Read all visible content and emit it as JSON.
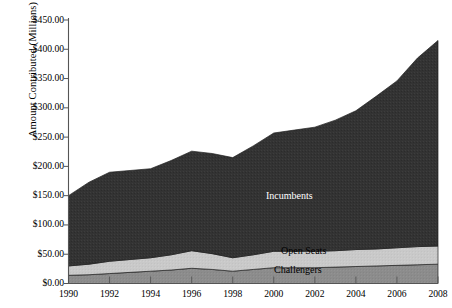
{
  "chart_data": {
    "type": "area",
    "stacked": true,
    "title": "",
    "xlabel": "",
    "ylabel": "Amount Contributed (Millions)",
    "x": [
      1990,
      1991,
      1992,
      1993,
      1994,
      1995,
      1996,
      1997,
      1998,
      1999,
      2000,
      2001,
      2002,
      2003,
      2004,
      2005,
      2006,
      2007,
      2008
    ],
    "xtick_labels": [
      "1990",
      "1992",
      "1994",
      "1996",
      "1998",
      "2000",
      "2002",
      "2004",
      "2006",
      "2008"
    ],
    "xticks": [
      1990,
      1992,
      1994,
      1996,
      1998,
      2000,
      2002,
      2004,
      2006,
      2008
    ],
    "xlim": [
      1990,
      2008
    ],
    "ylim": [
      0,
      450
    ],
    "yticks": [
      0,
      50,
      100,
      150,
      200,
      250,
      300,
      350,
      400,
      450
    ],
    "ytick_labels": [
      "$0.00",
      "$50.00",
      "$100.00",
      "$150.00",
      "$200.00",
      "$250.00",
      "$300.00",
      "$350.00",
      "$400.00",
      "$450.00"
    ],
    "grid": false,
    "legend_position": "inline-annotations",
    "series": [
      {
        "name": "Challengers",
        "color": "#8c8c8c",
        "values": [
          14,
          15,
          17,
          19,
          21,
          23,
          26,
          24,
          21,
          24,
          27,
          27,
          27,
          28,
          29,
          30,
          31,
          32,
          33
        ]
      },
      {
        "name": "Open Seats",
        "color": "#c9c9c9",
        "values": [
          16,
          18,
          21,
          22,
          23,
          26,
          30,
          27,
          23,
          25,
          28,
          28,
          28,
          28,
          29,
          29,
          30,
          31,
          31
        ]
      },
      {
        "name": "Incumbents",
        "color": "#333333",
        "values": [
          120,
          140,
          152,
          152,
          152,
          161,
          170,
          171,
          171,
          186,
          202,
          207,
          212,
          223,
          237,
          261,
          285,
          322,
          351
        ]
      }
    ],
    "series_totals": [
      150,
      173,
      190,
      193,
      196,
      210,
      226,
      222,
      215,
      235,
      257,
      262,
      267,
      279,
      295,
      320,
      346,
      385,
      415
    ],
    "annotations": [
      {
        "text": "Incumbents",
        "x_px": 266,
        "y_px": 190,
        "color": "#ffffff"
      },
      {
        "text": "Open Seats",
        "x_px": 281,
        "y_px": 245,
        "color": "#000000"
      },
      {
        "text": "Challengers",
        "x_px": 274,
        "y_px": 264,
        "color": "#000000"
      }
    ],
    "axis_color": "#555555"
  }
}
